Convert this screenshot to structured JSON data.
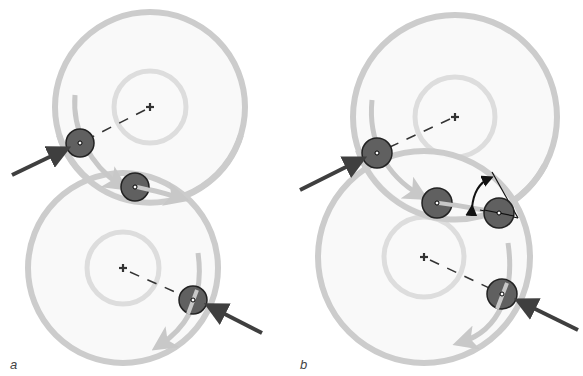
{
  "figure": {
    "panels": [
      {
        "label": "a",
        "label_pos": [
          10,
          357
        ],
        "wheels": [
          {
            "cx": 150,
            "cy": 107,
            "r_outer": 95,
            "r_inner": 36
          },
          {
            "cx": 123,
            "cy": 268,
            "r_outer": 95,
            "r_inner": 36
          }
        ],
        "rollers": [
          {
            "cx": 80,
            "cy": 143,
            "r": 14
          },
          {
            "cx": 135,
            "cy": 187,
            "r": 14
          },
          {
            "cx": 193,
            "cy": 300,
            "r": 14
          }
        ]
      },
      {
        "label": "b",
        "label_pos": [
          300,
          357
        ],
        "wheels": [
          {
            "cx": 455,
            "cy": 117,
            "r_outer": 102,
            "r_inner": 40
          },
          {
            "cx": 424,
            "cy": 257,
            "r_outer": 106,
            "r_inner": 40
          }
        ],
        "rollers": [
          {
            "cx": 377,
            "cy": 153,
            "r": 15
          },
          {
            "cx": 437,
            "cy": 203,
            "r": 15
          },
          {
            "cx": 499,
            "cy": 213,
            "r": 15
          },
          {
            "cx": 502,
            "cy": 294,
            "r": 15
          }
        ]
      }
    ],
    "colors": {
      "wheel_fill": "#f9f9f9",
      "wheel_stroke": "#cccccc",
      "inner_stroke": "#dddddd",
      "roller_fill": "#606060",
      "roller_stroke": "#222222",
      "force_arrow": "#3f3f3f",
      "motion_arrow": "#c8c8c8",
      "angle_arrow": "#111111"
    }
  }
}
